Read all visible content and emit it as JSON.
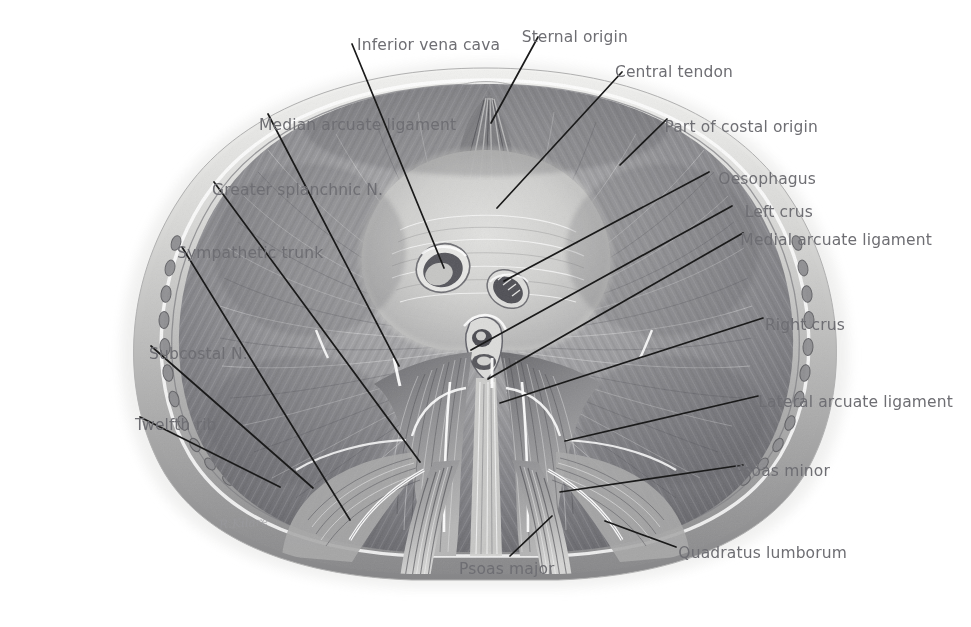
{
  "figure": {
    "background_color": "#ffffff",
    "label_color": "#6e6e73",
    "leader_color": "#1a1a1a",
    "artist_signature": "R.Kilare"
  },
  "labels": [
    {
      "id": "median-arcuate-ligament",
      "text": "Median arcuate ligament",
      "side": "left",
      "x": 259,
      "y": 118,
      "lx": 268,
      "ly": 114,
      "tx": 399,
      "ty": 366
    },
    {
      "id": "inferior-vena-cava",
      "text": "Inferior vena cava",
      "side": "left",
      "x": 357,
      "y": 38,
      "lx": 352,
      "ly": 44,
      "tx": 444,
      "ty": 268
    },
    {
      "id": "greater-splanchnic-nerve",
      "text": "Greater splanchnic N.",
      "side": "left",
      "x": 212,
      "y": 183,
      "lx": 214,
      "ly": 182,
      "tx": 420,
      "ty": 462
    },
    {
      "id": "sympathetic-trunk",
      "text": "Sympathetic trunk",
      "side": "left",
      "x": 177,
      "y": 246,
      "lx": 182,
      "ly": 247,
      "tx": 350,
      "ty": 520
    },
    {
      "id": "subcostal-nerve",
      "text": "Subcostal N.",
      "side": "left",
      "x": 149,
      "y": 347,
      "lx": 151,
      "ly": 346,
      "tx": 313,
      "ty": 488
    },
    {
      "id": "twelfth-rib",
      "text": "Twelfth rib",
      "side": "left",
      "x": 135,
      "y": 418,
      "lx": 140,
      "ly": 417,
      "tx": 280,
      "ty": 487
    },
    {
      "id": "sternal-origin",
      "text": "Sternal origin",
      "side": "left",
      "x": 628,
      "y": 30,
      "lx": 538,
      "ly": 37,
      "tx": 491,
      "ty": 123
    },
    {
      "id": "central-tendon",
      "text": "Central tendon",
      "side": "left",
      "x": 733,
      "y": 65,
      "lx": 622,
      "ly": 72,
      "tx": 497,
      "ty": 208
    },
    {
      "id": "part-of-costal-origin",
      "text": "Part of costal origin",
      "side": "left",
      "x": 818,
      "y": 120,
      "lx": 667,
      "ly": 119,
      "tx": 620,
      "ty": 165
    },
    {
      "id": "oesophagus",
      "text": "Oesophagus",
      "side": "left",
      "x": 816,
      "y": 172,
      "lx": 709,
      "ly": 172,
      "tx": 504,
      "ty": 281
    },
    {
      "id": "left-crus",
      "text": "Left crus",
      "side": "left",
      "x": 813,
      "y": 205,
      "lx": 732,
      "ly": 206,
      "tx": 471,
      "ty": 350
    },
    {
      "id": "medial-arcuate-ligament",
      "text": "Medial arcuate ligament",
      "side": "left",
      "x": 932,
      "y": 233,
      "lx": 743,
      "ly": 233,
      "tx": 488,
      "ty": 379
    },
    {
      "id": "right-crus",
      "text": "Right crus",
      "side": "left",
      "x": 845,
      "y": 318,
      "lx": 763,
      "ly": 318,
      "tx": 500,
      "ty": 403
    },
    {
      "id": "lateral-arcuate-ligament",
      "text": "Lateral arcuate ligament",
      "side": "left",
      "x": 953,
      "y": 395,
      "lx": 758,
      "ly": 396,
      "tx": 565,
      "ty": 441
    },
    {
      "id": "psoas-minor",
      "text": "Psoas minor",
      "side": "left",
      "x": 830,
      "y": 464,
      "lx": 743,
      "ly": 465,
      "tx": 560,
      "ty": 492
    },
    {
      "id": "quadratus-lumborum",
      "text": "Quadratus lumborum",
      "side": "left",
      "x": 847,
      "y": 546,
      "lx": 676,
      "ly": 547,
      "tx": 605,
      "ty": 521
    },
    {
      "id": "psoas-major",
      "text": "Psoas major",
      "side": "left",
      "x": 459,
      "y": 562,
      "lx": 510,
      "ly": 556,
      "tx": 552,
      "ty": 516
    }
  ],
  "structures": [
    {
      "id": "thoracic-wall-rim",
      "name": "Thoracic wall rim"
    },
    {
      "id": "central-tendon-area",
      "name": "Central tendon"
    },
    {
      "id": "caval-opening",
      "name": "Caval opening (T8)"
    },
    {
      "id": "oesophageal-hiatus",
      "name": "Oesophageal hiatus (T10)"
    },
    {
      "id": "aortic-hiatus",
      "name": "Aortic hiatus (T12)"
    },
    {
      "id": "left-crus-muscle",
      "name": "Left crus"
    },
    {
      "id": "right-crus-muscle",
      "name": "Right crus"
    },
    {
      "id": "psoas-major-muscle",
      "name": "Psoas major"
    },
    {
      "id": "psoas-minor-muscle",
      "name": "Psoas minor"
    },
    {
      "id": "quadratus-lumborum-muscle",
      "name": "Quadratus lumborum"
    },
    {
      "id": "vertebral-bodies",
      "name": "Vertebral column"
    },
    {
      "id": "rib-cage",
      "name": "Rib cage / costal margin"
    }
  ],
  "footer": {
    "caption": ""
  }
}
